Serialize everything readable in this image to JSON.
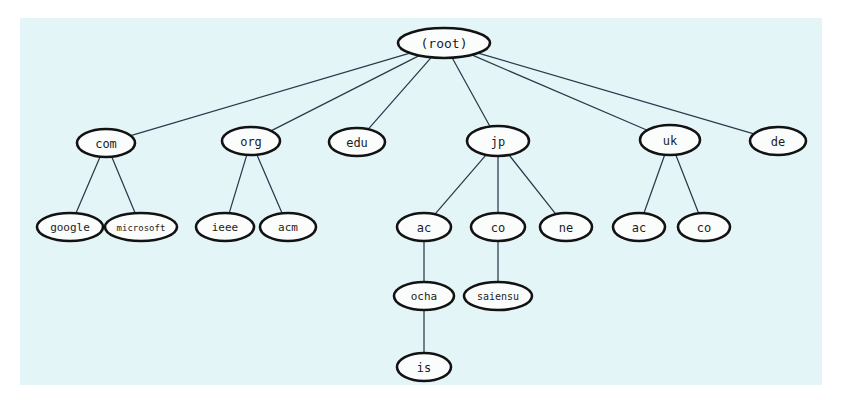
{
  "figure": {
    "background_color": "#ffffff",
    "canvas_color": "#e4f5f8",
    "node_fill": "#fbfdfd",
    "node_stroke": "#121212",
    "edge_color": "#2b3a4a",
    "label_color": "#1b1b1b"
  },
  "canvas": {
    "x": 20,
    "y": 18,
    "width": 802,
    "height": 367
  },
  "chart_data": {
    "type": "diagram",
    "diagram_kind": "tree",
    "root": "(root)",
    "depth": 5,
    "node_count": 19,
    "edge_count": 18,
    "nodes": [
      {
        "id": "root",
        "label": "(root)",
        "cx": 444,
        "cy": 43,
        "rx": 46,
        "ry": 15,
        "font_size": 13,
        "level": 0
      },
      {
        "id": "com",
        "label": "com",
        "cx": 106,
        "cy": 143,
        "rx": 29,
        "ry": 14,
        "font_size": 12,
        "level": 1
      },
      {
        "id": "org",
        "label": "org",
        "cx": 251,
        "cy": 141,
        "rx": 29,
        "ry": 14,
        "font_size": 12,
        "level": 1
      },
      {
        "id": "edu",
        "label": "edu",
        "cx": 357,
        "cy": 142,
        "rx": 28,
        "ry": 14,
        "font_size": 12,
        "level": 1
      },
      {
        "id": "jp",
        "label": "jp",
        "cx": 498,
        "cy": 141,
        "rx": 31,
        "ry": 15,
        "font_size": 12,
        "level": 1
      },
      {
        "id": "uk",
        "label": "uk",
        "cx": 670,
        "cy": 140,
        "rx": 30,
        "ry": 15,
        "font_size": 12,
        "level": 1
      },
      {
        "id": "de",
        "label": "de",
        "cx": 778,
        "cy": 141,
        "rx": 28,
        "ry": 14,
        "font_size": 12,
        "level": 1
      },
      {
        "id": "google",
        "label": "google",
        "cx": 70,
        "cy": 227,
        "rx": 33,
        "ry": 14,
        "font_size": 11,
        "level": 2
      },
      {
        "id": "microsoft",
        "label": "microsoft",
        "cx": 141,
        "cy": 227,
        "rx": 36,
        "ry": 14,
        "font_size": 9,
        "level": 2
      },
      {
        "id": "ieee",
        "label": "ieee",
        "cx": 225,
        "cy": 227,
        "rx": 29,
        "ry": 14,
        "font_size": 11,
        "level": 2
      },
      {
        "id": "acm",
        "label": "acm",
        "cx": 288,
        "cy": 227,
        "rx": 28,
        "ry": 14,
        "font_size": 11,
        "level": 2
      },
      {
        "id": "jp-ac",
        "label": "ac",
        "cx": 424,
        "cy": 227,
        "rx": 27,
        "ry": 14,
        "font_size": 12,
        "level": 2
      },
      {
        "id": "jp-co",
        "label": "co",
        "cx": 498,
        "cy": 227,
        "rx": 27,
        "ry": 14,
        "font_size": 12,
        "level": 2
      },
      {
        "id": "jp-ne",
        "label": "ne",
        "cx": 566,
        "cy": 227,
        "rx": 26,
        "ry": 14,
        "font_size": 12,
        "level": 2
      },
      {
        "id": "uk-ac",
        "label": "ac",
        "cx": 639,
        "cy": 227,
        "rx": 26,
        "ry": 14,
        "font_size": 12,
        "level": 2
      },
      {
        "id": "uk-co",
        "label": "co",
        "cx": 704,
        "cy": 227,
        "rx": 26,
        "ry": 14,
        "font_size": 12,
        "level": 2
      },
      {
        "id": "ocha",
        "label": "ocha",
        "cx": 424,
        "cy": 296,
        "rx": 30,
        "ry": 14,
        "font_size": 11,
        "level": 3
      },
      {
        "id": "saiensu",
        "label": "saiensu",
        "cx": 498,
        "cy": 296,
        "rx": 34,
        "ry": 14,
        "font_size": 10,
        "level": 3
      },
      {
        "id": "is",
        "label": "is",
        "cx": 424,
        "cy": 367,
        "rx": 27,
        "ry": 14,
        "font_size": 12,
        "level": 4
      }
    ],
    "edges": [
      {
        "from": "root",
        "to": "com"
      },
      {
        "from": "root",
        "to": "org"
      },
      {
        "from": "root",
        "to": "edu"
      },
      {
        "from": "root",
        "to": "jp"
      },
      {
        "from": "root",
        "to": "uk"
      },
      {
        "from": "root",
        "to": "de"
      },
      {
        "from": "com",
        "to": "google"
      },
      {
        "from": "com",
        "to": "microsoft"
      },
      {
        "from": "org",
        "to": "ieee"
      },
      {
        "from": "org",
        "to": "acm"
      },
      {
        "from": "jp",
        "to": "jp-ac"
      },
      {
        "from": "jp",
        "to": "jp-co"
      },
      {
        "from": "jp",
        "to": "jp-ne"
      },
      {
        "from": "uk",
        "to": "uk-ac"
      },
      {
        "from": "uk",
        "to": "uk-co"
      },
      {
        "from": "jp-ac",
        "to": "ocha"
      },
      {
        "from": "jp-co",
        "to": "saiensu"
      },
      {
        "from": "ocha",
        "to": "is"
      }
    ]
  }
}
